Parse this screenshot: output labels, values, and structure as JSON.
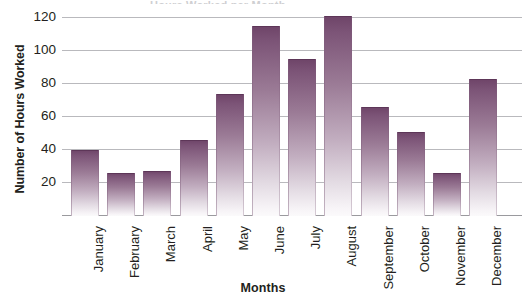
{
  "chart_data": {
    "type": "bar",
    "title": "",
    "xlabel": "Months",
    "ylabel": "Number of Hours Worked",
    "categories": [
      "January",
      "February",
      "March",
      "April",
      "May",
      "June",
      "July",
      "August",
      "September",
      "October",
      "November",
      "December"
    ],
    "values": [
      40,
      26,
      27,
      46,
      74,
      115,
      95,
      121,
      66,
      51,
      26,
      83
    ],
    "yticks": [
      20,
      40,
      60,
      80,
      100,
      120
    ],
    "ytick_labels": [
      "20",
      "40",
      "60",
      "80",
      "100",
      "120"
    ],
    "ylim": [
      0,
      127
    ],
    "grid": true,
    "legend": "none",
    "series_name": "Hours Worked",
    "bar_color_top": "#6e4468",
    "bar_color_bottom": "#fbfafb",
    "gridline_color": "#b9b9bd",
    "text_color": "#231f20"
  },
  "axis": {
    "y_title": "Number of Hours Worked",
    "x_title": "Months"
  },
  "header": {
    "clipped_title": "Hours Worked per Month"
  }
}
